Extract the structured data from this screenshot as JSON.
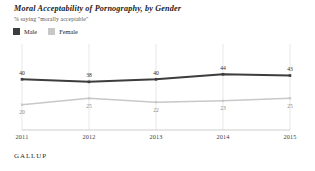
{
  "chart": {
    "title": "Moral Acceptability of Pornography, by Gender",
    "subtitle": "% saying \"morally acceptable\"",
    "source_logo": "GALLUP"
  },
  "legend": {
    "position": "top-left",
    "items": [
      {
        "label": "Male",
        "color": "#3d3d3d",
        "icon": "square-swatch"
      },
      {
        "label": "Female",
        "color": "#c8c8c8",
        "icon": "square-swatch"
      }
    ]
  },
  "chart_data": {
    "type": "line",
    "title": "Moral Acceptability of Pornography, by Gender",
    "subtitle": "% saying \"morally acceptable\"",
    "xlabel": "",
    "ylabel": "",
    "categories": [
      "2011",
      "2012",
      "2013",
      "2014",
      "2015"
    ],
    "x_tick_labels": [
      "2011",
      "2012",
      "2013",
      "2014",
      "2015"
    ],
    "ylim": [
      0,
      60
    ],
    "grid": "vertical-only",
    "legend_position": "top-left",
    "series": [
      {
        "name": "Male",
        "color": "#3d3d3d",
        "values": [
          40,
          38,
          40,
          44,
          43
        ],
        "labels": [
          "40",
          "38",
          "40",
          "44",
          "43"
        ],
        "label_position": "above"
      },
      {
        "name": "Female",
        "color": "#c8c8c8",
        "values": [
          20,
          25,
          22,
          23,
          25
        ],
        "labels": [
          "20",
          "25",
          "22",
          "23",
          "25"
        ],
        "label_position": "below"
      }
    ]
  }
}
